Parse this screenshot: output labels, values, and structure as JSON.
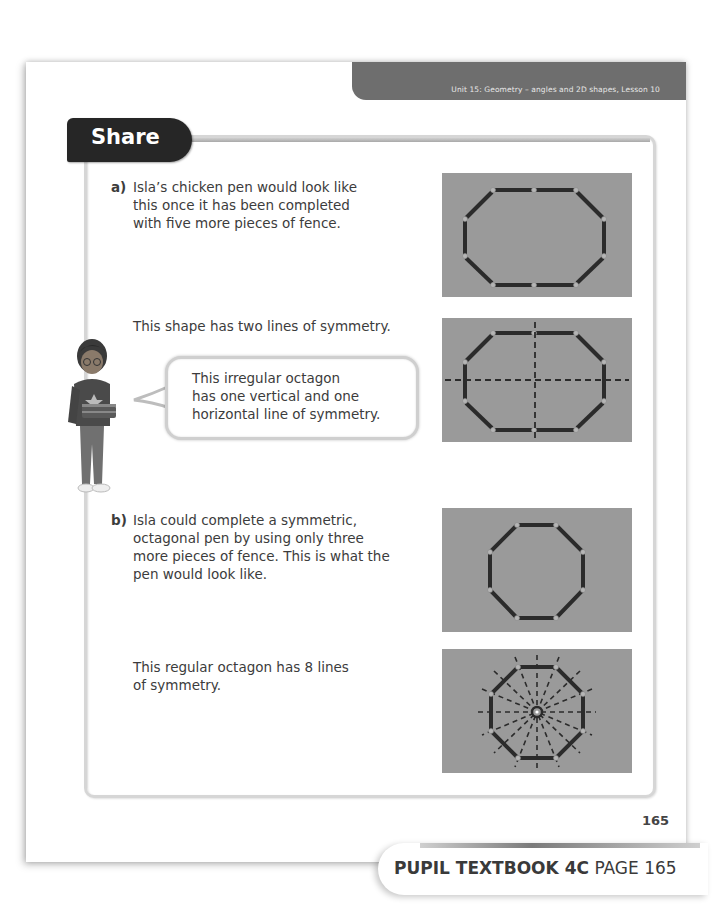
{
  "header": {
    "unit_banner": "Unit 15: Geometry – angles and 2D shapes, Lesson 10"
  },
  "section": {
    "title": "Share"
  },
  "part_a": {
    "label": "a)",
    "lines": [
      "Isla’s chicken pen would look like",
      "this once it has been completed",
      "with five more pieces of fence."
    ],
    "symmetry_note": "This shape has two lines of symmetry.",
    "speech_bubble": [
      "This irregular octagon",
      "has one vertical and one",
      "horizontal line of symmetry."
    ],
    "figures": [
      {
        "name": "irregular-octagon-pen",
        "description": "Irregular octagon made of fence pieces"
      },
      {
        "name": "irregular-octagon-symmetry",
        "description": "Irregular octagon with one vertical and one horizontal dashed line of symmetry"
      }
    ]
  },
  "part_b": {
    "label": "b)",
    "lines": [
      "Isla could complete a symmetric,",
      "octagonal pen by using only three",
      "more pieces of fence. This is what the",
      "pen would look like."
    ],
    "symmetry_note_lines": [
      "This regular octagon has 8 lines",
      "of symmetry."
    ],
    "figures": [
      {
        "name": "regular-octagon-pen",
        "description": "Regular octagon made of fence pieces"
      },
      {
        "name": "regular-octagon-symmetry",
        "description": "Regular octagon with 8 dashed lines of symmetry through the centre"
      }
    ]
  },
  "footer": {
    "page_number": "165",
    "book_label": "PUPIL TEXTBOOK 4C",
    "page_label": "PAGE 165"
  },
  "colors": {
    "panel_bg": "#9a9a9a",
    "fence": "#2b2b2b",
    "post": "#b5b5b5",
    "banner": "#6e6e6e",
    "share_tab": "#262626"
  }
}
